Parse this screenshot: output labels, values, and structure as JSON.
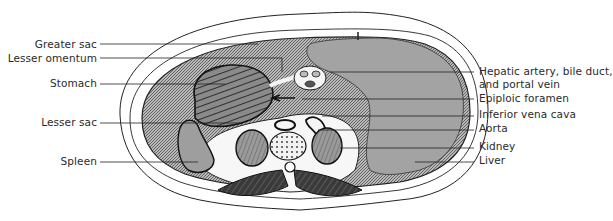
{
  "figure": {
    "type": "anatomical cross-section"
  },
  "colors": {
    "ink": "#1e1e1e",
    "shaded_region": "#9a9a9a",
    "organ_gray": "#a8a8a8",
    "background": "#ffffff",
    "dark_muscle": "#2b2b2b"
  },
  "labels": {
    "left": [
      {
        "id": "greater-sac",
        "text": "Greater sac"
      },
      {
        "id": "lesser-omentum",
        "text": "Lesser omentum"
      },
      {
        "id": "stomach",
        "text": "Stomach"
      },
      {
        "id": "lesser-sac",
        "text": "Lesser sac"
      },
      {
        "id": "spleen",
        "text": "Spleen"
      }
    ],
    "right": [
      {
        "id": "hepatic-triad",
        "text": "Hepatic artery, bile duct,",
        "text2": "and portal vein"
      },
      {
        "id": "epiploic-foramen",
        "text": "Epiploic foramen"
      },
      {
        "id": "inferior-vena-cava",
        "text": "Inferior vena cava"
      },
      {
        "id": "aorta",
        "text": "Aorta"
      },
      {
        "id": "kidney",
        "text": "Kidney"
      },
      {
        "id": "liver",
        "text": "Liver"
      }
    ]
  }
}
